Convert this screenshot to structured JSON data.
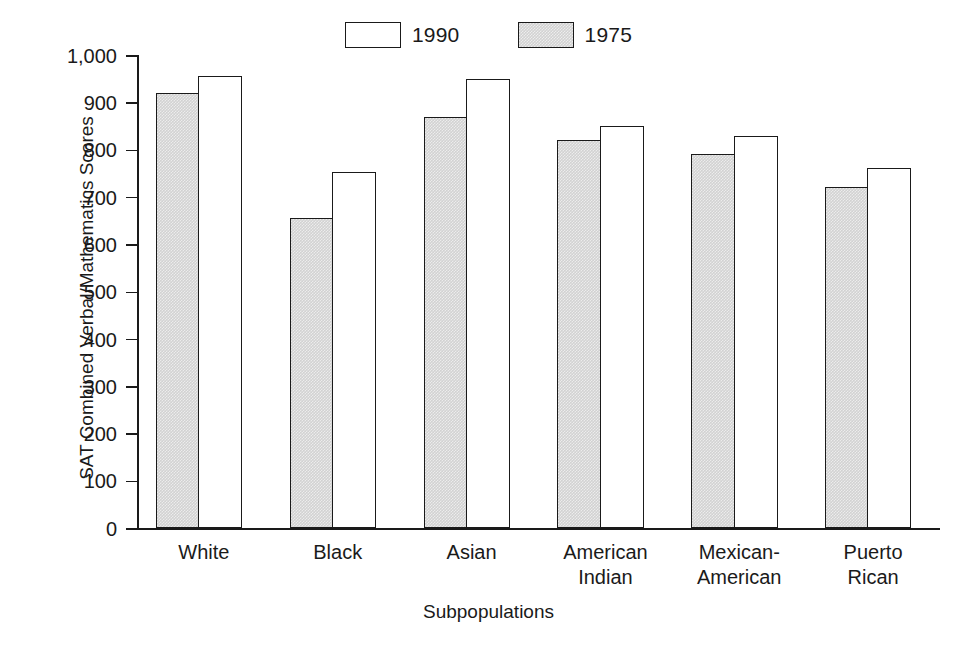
{
  "chart_data": {
    "type": "bar",
    "title": "",
    "xlabel": "Subpopulations",
    "ylabel": "SAT Combined Verbal/Mathematics Scores",
    "categories": [
      "White",
      "Black",
      "Asian",
      "American\nIndian",
      "Mexican-\nAmerican",
      "Puerto\nRican"
    ],
    "series": [
      {
        "name": "1975",
        "style": "shaded",
        "values": [
          920,
          655,
          870,
          820,
          790,
          720
        ]
      },
      {
        "name": "1990",
        "style": "open",
        "values": [
          955,
          752,
          950,
          850,
          828,
          762
        ]
      }
    ],
    "series_draw_order": [
      "1975",
      "1990"
    ],
    "ylim": [
      0,
      1000
    ],
    "yticks": [
      0,
      100,
      200,
      300,
      400,
      500,
      600,
      700,
      800,
      900,
      1000
    ],
    "ytick_labels": [
      "0",
      "100",
      "200",
      "300",
      "400",
      "500",
      "600",
      "700",
      "800",
      "900",
      "1,000"
    ],
    "grid": false,
    "legend_position": "top-center",
    "legend_entries": [
      {
        "label": "1990",
        "style": "open"
      },
      {
        "label": "1975",
        "style": "shaded"
      }
    ],
    "colors": {
      "axis": "#1a1a1a",
      "open_fill": "#ffffff",
      "shaded_fill": "#d2d2d2",
      "background": "#ffffff"
    }
  }
}
